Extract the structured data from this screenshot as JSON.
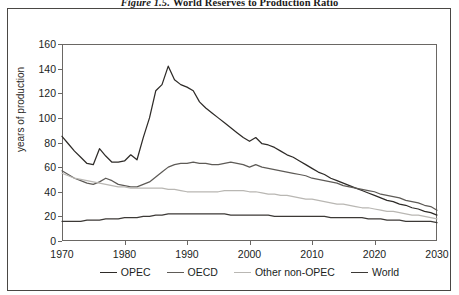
{
  "figure": {
    "number": "Figure 1.5.",
    "title": "World Reserves to Production Ratio"
  },
  "axes": {
    "ylabel": "years of production",
    "yticks": [
      "0",
      "20",
      "40",
      "60",
      "80",
      "100",
      "120",
      "140",
      "160"
    ],
    "xticks": [
      "1970",
      "1980",
      "1990",
      "2000",
      "2010",
      "2020",
      "2030"
    ]
  },
  "colors": {
    "opec": "#2e2b28",
    "oecd": "#5e5b57",
    "other_non_opec": "#b9b7b3",
    "world": "#3c3936",
    "frame": "#6a6764",
    "outer_frame": "#4a4744",
    "text": "#201e1c"
  },
  "legend": {
    "position": "bottom",
    "items": [
      {
        "label": "OPEC",
        "color": "#2e2b28"
      },
      {
        "label": "OECD",
        "color": "#5e5b57"
      },
      {
        "label": "Other non-OPEC",
        "color": "#b9b7b3"
      },
      {
        "label": "World",
        "color": "#3c3936"
      }
    ]
  },
  "chart_data": {
    "type": "line",
    "title": "World Reserves to Production Ratio",
    "xlabel": "",
    "ylabel": "years of production",
    "xlim": [
      1970,
      2030
    ],
    "ylim": [
      0,
      160
    ],
    "ytick_step": 20,
    "xtick_step": 10,
    "grid": false,
    "legend_position": "bottom",
    "x": [
      1970,
      1971,
      1972,
      1973,
      1974,
      1975,
      1976,
      1977,
      1978,
      1979,
      1980,
      1981,
      1982,
      1983,
      1984,
      1985,
      1986,
      1987,
      1988,
      1989,
      1990,
      1991,
      1992,
      1993,
      1994,
      1995,
      1996,
      1997,
      1998,
      1999,
      2000,
      2001,
      2002,
      2003,
      2004,
      2005,
      2006,
      2007,
      2008,
      2009,
      2010,
      2011,
      2012,
      2013,
      2014,
      2015,
      2016,
      2017,
      2018,
      2019,
      2020,
      2021,
      2022,
      2023,
      2024,
      2025,
      2026,
      2027,
      2028,
      2029,
      2030
    ],
    "series": [
      {
        "name": "OPEC",
        "color": "#2e2b28",
        "values": [
          85,
          79,
          73,
          68,
          63,
          62,
          75,
          69,
          64,
          64,
          65,
          70,
          66,
          84,
          100,
          122,
          127,
          142,
          131,
          127,
          125,
          122,
          113,
          108,
          104,
          100,
          96,
          92,
          88,
          84,
          81,
          84,
          79,
          78,
          76,
          73,
          70,
          68,
          65,
          62,
          59,
          56,
          54,
          51,
          49,
          47,
          45,
          43,
          41,
          39,
          37,
          35,
          33,
          32,
          30,
          29,
          27,
          26,
          24,
          23,
          21
        ]
      },
      {
        "name": "OECD",
        "color": "#5e5b57",
        "values": [
          57,
          54,
          51,
          49,
          47,
          46,
          48,
          51,
          49,
          46,
          45,
          44,
          44,
          46,
          48,
          52,
          56,
          60,
          62,
          63,
          63,
          64,
          63,
          63,
          62,
          62,
          63,
          64,
          63,
          62,
          60,
          62,
          60,
          59,
          58,
          57,
          56,
          55,
          54,
          53,
          51,
          50,
          49,
          48,
          47,
          45,
          44,
          43,
          42,
          41,
          40,
          38,
          37,
          36,
          35,
          33,
          32,
          31,
          29,
          28,
          25
        ]
      },
      {
        "name": "Other non-OPEC",
        "color": "#b9b7b3",
        "values": [
          55,
          53,
          51,
          50,
          49,
          48,
          47,
          46,
          45,
          44,
          44,
          43,
          43,
          43,
          43,
          43,
          43,
          42,
          42,
          41,
          40,
          40,
          40,
          40,
          40,
          40,
          41,
          41,
          41,
          41,
          40,
          40,
          39,
          38,
          38,
          37,
          37,
          36,
          35,
          34,
          34,
          33,
          32,
          31,
          30,
          30,
          29,
          28,
          27,
          27,
          26,
          25,
          24,
          24,
          23,
          22,
          21,
          21,
          20,
          19,
          18
        ]
      },
      {
        "name": "World",
        "color": "#3c3936",
        "values": [
          16,
          16,
          16,
          16,
          17,
          17,
          17,
          18,
          18,
          18,
          19,
          19,
          19,
          20,
          20,
          21,
          21,
          22,
          22,
          22,
          22,
          22,
          22,
          22,
          22,
          22,
          22,
          21,
          21,
          21,
          21,
          21,
          21,
          21,
          20,
          20,
          20,
          20,
          20,
          20,
          20,
          20,
          20,
          19,
          19,
          19,
          19,
          19,
          19,
          18,
          18,
          18,
          17,
          17,
          17,
          16,
          16,
          16,
          16,
          16,
          15
        ]
      }
    ]
  }
}
